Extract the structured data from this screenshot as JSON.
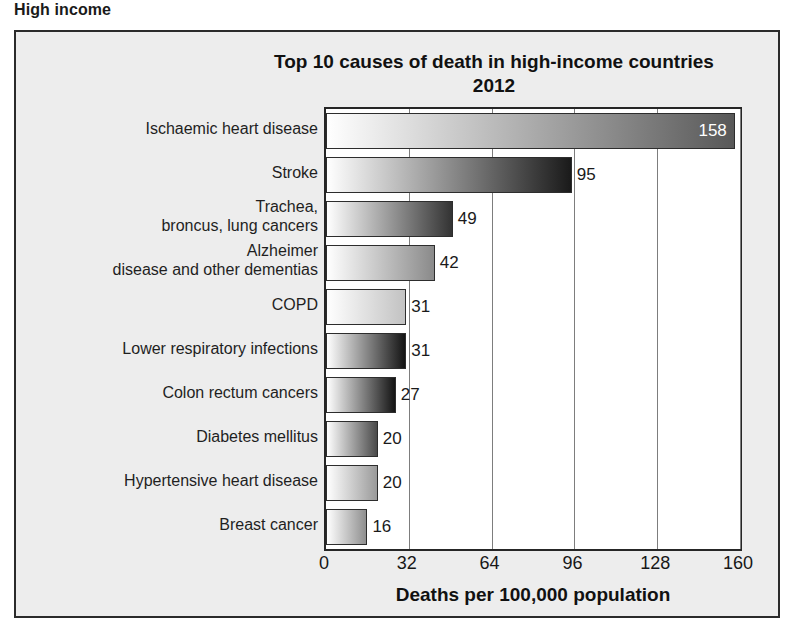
{
  "page": {
    "heading": "High income"
  },
  "chart": {
    "title_line1": "Top 10 causes of death in high-income countries",
    "title_line2": "2012",
    "x_axis_title": "Deaths per 100,000 population"
  },
  "chart_data": {
    "type": "bar",
    "orientation": "horizontal",
    "title": "Top 10 causes of death in high-income countries 2012",
    "subtitle": "2012",
    "xlabel": "Deaths per 100,000 population",
    "ylabel": "",
    "xlim": [
      0,
      160
    ],
    "xticks": [
      0,
      32,
      64,
      96,
      128,
      160
    ],
    "grid": true,
    "legend": "none",
    "categories": [
      "Ischaemic heart disease",
      "Stroke",
      "Trachea,\nbroncus, lung cancers",
      "Alzheimer\ndisease and other dementias",
      "COPD",
      "Lower respiratory infections",
      "Colon rectum cancers",
      "Diabetes mellitus",
      "Hypertensive heart disease",
      "Breast cancer"
    ],
    "values": [
      158,
      95,
      49,
      42,
      31,
      31,
      27,
      20,
      20,
      16
    ],
    "value_labels": [
      "158",
      "95",
      "49",
      "42",
      "31",
      "31",
      "27",
      "20",
      "20",
      "16"
    ],
    "label_placement": [
      "inside",
      "outside",
      "outside",
      "outside",
      "outside",
      "outside",
      "outside",
      "outside",
      "outside",
      "outside"
    ],
    "bar_gradients": [
      [
        "#ffffff",
        "#585858"
      ],
      [
        "#ffffff",
        "#1a1a1a"
      ],
      [
        "#ffffff",
        "#333333"
      ],
      [
        "#ffffff",
        "#8a8a8a"
      ],
      [
        "#ffffff",
        "#c2c2c2"
      ],
      [
        "#ffffff",
        "#141414"
      ],
      [
        "#ffffff",
        "#141414"
      ],
      [
        "#ffffff",
        "#4a4a4a"
      ],
      [
        "#ffffff",
        "#9a9a9a"
      ],
      [
        "#ffffff",
        "#8f8f8f"
      ]
    ]
  },
  "colors": {
    "panel_background": "#ededed",
    "plot_background": "#ffffff",
    "frame": "#2b2b2b",
    "gridline": "#7d7d7d",
    "text": "#1a1a1a"
  }
}
